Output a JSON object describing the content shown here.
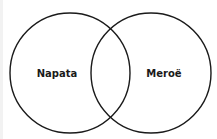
{
  "diagram": {
    "type": "venn",
    "stroke_color": "#1a1a1a",
    "background": "#ffffff",
    "sets": [
      {
        "label": "Napata",
        "cx": 70,
        "cy": 73,
        "r": 60
      },
      {
        "label": "Meroë",
        "cx": 151,
        "cy": 73,
        "r": 60
      }
    ],
    "intersection_label": ""
  }
}
